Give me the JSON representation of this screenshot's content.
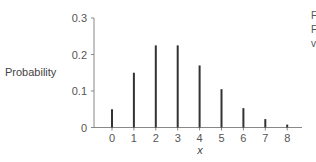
{
  "chart_data": {
    "type": "bar",
    "title": "",
    "xlabel": "x",
    "ylabel": "Probability",
    "categories": [
      "0",
      "1",
      "2",
      "3",
      "4",
      "5",
      "6",
      "7",
      "8"
    ],
    "values": [
      0.05,
      0.15,
      0.225,
      0.225,
      0.17,
      0.105,
      0.053,
      0.023,
      0.008
    ],
    "yticks": [
      "0",
      "0.1",
      "0.2",
      "0.3"
    ],
    "ylim": [
      0,
      0.3
    ],
    "grid": false,
    "legend": null,
    "style": "stem / spike bars"
  },
  "clipped_text": [
    "F",
    "F",
    "v"
  ],
  "colors": {
    "bar": "#333333",
    "axis": "#888888",
    "text": "#555555"
  }
}
